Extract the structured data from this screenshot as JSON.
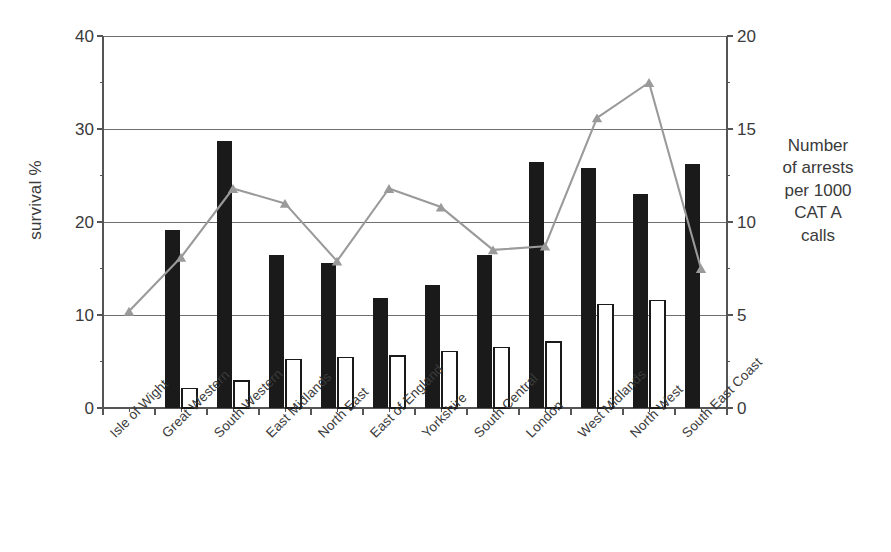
{
  "chart_data": {
    "type": "bar",
    "title": "",
    "subtitle": "",
    "categories": [
      "Isle of Wight",
      "Great Western",
      "South Western",
      "East Midlands",
      "North East",
      "East of England",
      "Yorkshire",
      "South Central",
      "London",
      "West Midlands",
      "North West",
      "South East Coast"
    ],
    "xlabel": "",
    "ylabel": "survival %",
    "ylabel_secondary": "Number of arrests per 1000 CAT A calls",
    "ylim": [
      0,
      40
    ],
    "ylim_secondary": [
      0,
      20
    ],
    "yticks": [
      0,
      10,
      20,
      30,
      40
    ],
    "yticks_secondary": [
      0,
      5,
      10,
      15,
      20
    ],
    "grid": true,
    "legend": "none",
    "series": [
      {
        "name": "survival %",
        "type": "bar",
        "axis": "left",
        "color": "#1a1a1a",
        "style": "filled",
        "values": [
          null,
          19.1,
          28.7,
          16.5,
          15.6,
          11.8,
          13.2,
          16.5,
          26.4,
          25.8,
          23.0,
          26.2
        ]
      },
      {
        "name": "white bars",
        "type": "bar",
        "axis": "left",
        "color": "#ffffff",
        "style": "outlined",
        "values": [
          null,
          2.1,
          2.9,
          5.2,
          5.4,
          5.6,
          6.1,
          6.5,
          7.1,
          11.1,
          11.6,
          null
        ]
      },
      {
        "name": "Number of arrests per 1000 CAT A calls",
        "type": "line",
        "axis": "right",
        "color": "#9a9a9a",
        "marker": "triangle",
        "values": [
          5.2,
          8.1,
          11.8,
          11.0,
          7.9,
          11.8,
          10.8,
          8.5,
          8.7,
          15.6,
          17.5,
          7.5
        ]
      }
    ]
  },
  "axes": {
    "left_title": "survival %",
    "right_title_lines": [
      "Number",
      "of arrests",
      "per 1000",
      "CAT A",
      "calls"
    ],
    "left_ticks": [
      "40",
      "30",
      "20",
      "10",
      "0"
    ],
    "right_ticks": [
      "20",
      "15",
      "10",
      "5",
      "0"
    ]
  },
  "colors": {
    "bar_filled": "#1a1a1a",
    "bar_outline": "#1a1a1a",
    "line": "#9a9a9a",
    "axis": "#555555",
    "grid": "#6f6f6f",
    "text": "#3a3a3a",
    "background": "#ffffff"
  }
}
